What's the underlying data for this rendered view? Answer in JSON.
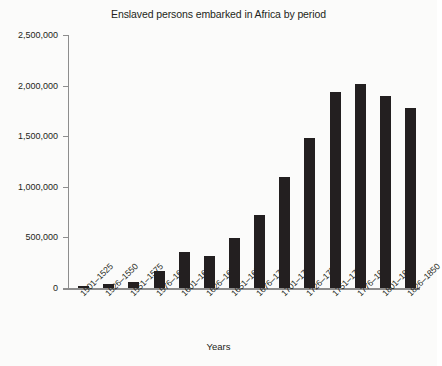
{
  "chart_data": {
    "type": "bar",
    "title": "Enslaved persons embarked in Africa by period",
    "xlabel": "Years",
    "ylabel": "",
    "grid": false,
    "legend": false,
    "ylim": [
      0,
      2500000
    ],
    "ytick_labels": [
      "2,500,000",
      "2,000,000",
      "1,500,000",
      "1,000,000",
      "500,000",
      "0"
    ],
    "ytick_values": [
      2500000,
      2000000,
      1500000,
      1000000,
      500000,
      0
    ],
    "categories": [
      "1501–1525",
      "1526–1550",
      "1551–1575",
      "1576–1600",
      "1601–1625",
      "1626–1650",
      "1651–1675",
      "1676–1700",
      "1701–1725",
      "1726–1750",
      "1751–1775",
      "1776–1800",
      "1801–1825",
      "1826–1850"
    ],
    "values": [
      20000,
      40000,
      60000,
      165000,
      355000,
      320000,
      495000,
      725000,
      1100000,
      1480000,
      1935000,
      2020000,
      1895000,
      1780000
    ],
    "bar_color": "#231f20",
    "axis_color": "#8d8d8d",
    "background_color": "#fbfbfa"
  }
}
